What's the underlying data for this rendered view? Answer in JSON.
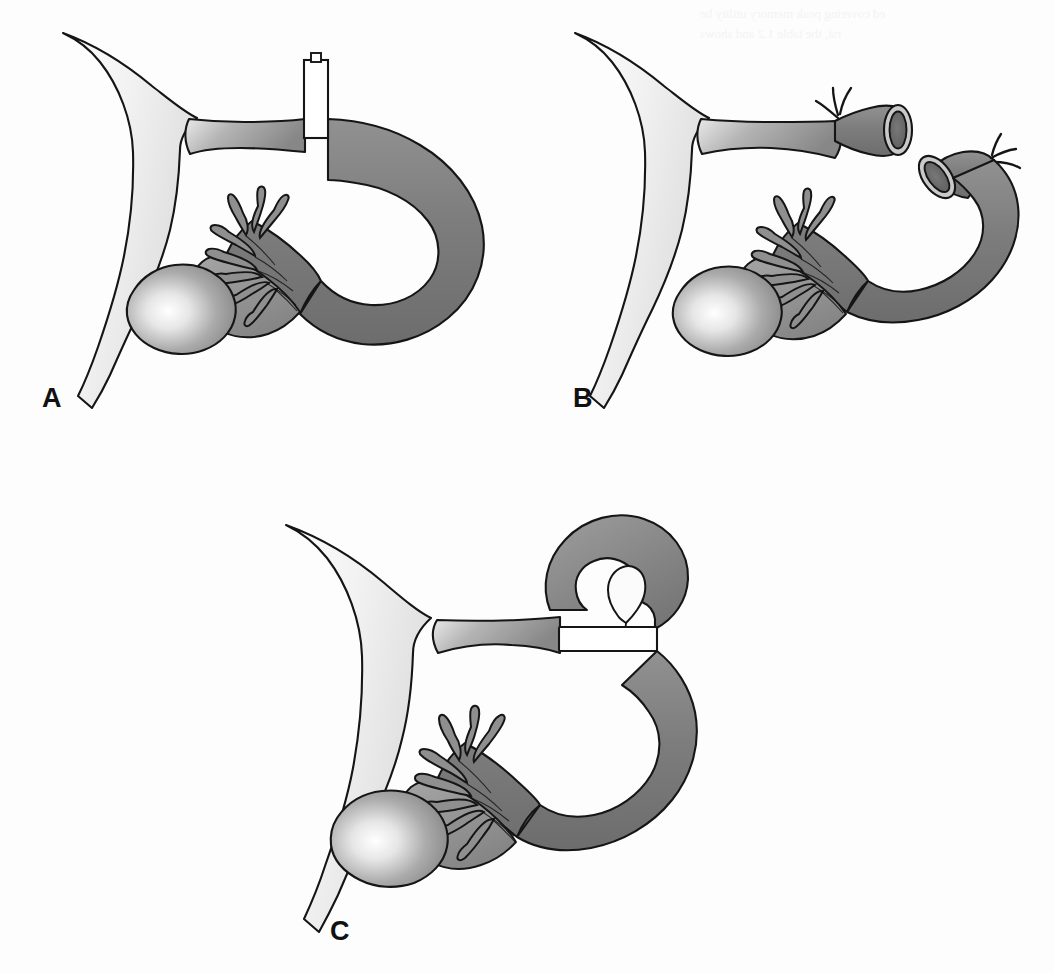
{
  "figure": {
    "background_color": "#fdfdfd",
    "outline_color": "#151515",
    "tube_gray": "#7f7f7f",
    "tube_gray_dark": "#6a6a6a",
    "tube_gray_light": "#a9a9a9",
    "uterus_light": "#fafafa",
    "uterus_mid": "#e3e3e3",
    "ovary_highlight": "#ffffff",
    "device_white": "#ffffff",
    "lumen_dark": "#6e6e6e",
    "lumen_ring": "#d2d2d2"
  },
  "panels": [
    {
      "id": "a",
      "label": "A",
      "caption": "Tubal occlusion clip applied across the isthmic portion of the fallopian tube",
      "method": "clip",
      "device": {
        "name": "tubal-clip",
        "color": "#ffffff",
        "has_knob": true,
        "orientation": "vertical"
      },
      "structures": [
        "uterus",
        "fallopian-tube",
        "fimbriae",
        "ovary",
        "clip"
      ]
    },
    {
      "id": "b",
      "label": "B",
      "caption": "Fallopian tube divided and both cut ends ligated with suture",
      "method": "cut-and-ligate",
      "device": {
        "name": "suture-ligature",
        "color": "#151515",
        "tails_per_end": 3,
        "ends": 2
      },
      "structures": [
        "uterus",
        "fallopian-tube",
        "proximal-stump",
        "distal-stump",
        "lumen",
        "fimbriae",
        "ovary"
      ]
    },
    {
      "id": "c",
      "label": "C",
      "caption": "Silastic band (Falope ring) applied to a knuckle of fallopian tube",
      "method": "silastic-band-loop",
      "device": {
        "name": "falope-ring-band",
        "color": "#ffffff",
        "orientation": "horizontal"
      },
      "structures": [
        "uterus",
        "fallopian-tube",
        "tubal-loop",
        "band",
        "fimbriae",
        "ovary"
      ]
    }
  ],
  "bleedthrough": {
    "visible": true,
    "legible": false,
    "text": "ed covering peak memory utility be\nrst, the table 1.2 and shows"
  }
}
